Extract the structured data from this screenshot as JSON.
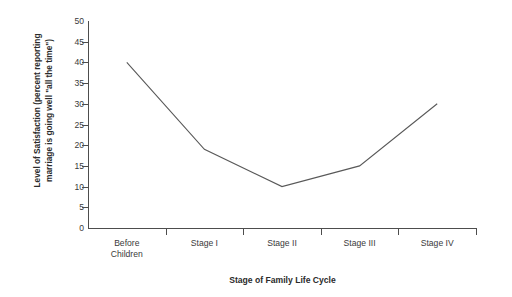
{
  "chart_data": {
    "type": "line",
    "title": "",
    "xlabel": "Stage of Family Life Cycle",
    "ylabel": "Level of Satisfaction (percent reporting\nmarriage is going well \"all the time\")",
    "categories": [
      "Before\nChildren",
      "Stage I",
      "Stage II",
      "Stage III",
      "Stage IV"
    ],
    "values": [
      40,
      19,
      10,
      15,
      30
    ],
    "ylim": [
      0,
      50
    ],
    "ytick_values": [
      50,
      45,
      40,
      35,
      30,
      25,
      20,
      15,
      10,
      5,
      0
    ],
    "ytick_labels": [
      "50",
      "45",
      "40",
      "35",
      "30",
      "25",
      "20",
      "15",
      "10",
      "5",
      "0"
    ],
    "grid": false,
    "legend": false,
    "series_color": "#595959",
    "axis_color": "#4d4d4d",
    "background": "#ffffff"
  }
}
